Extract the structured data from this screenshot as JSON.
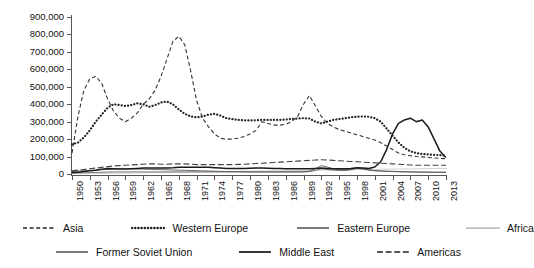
{
  "chart_data": {
    "type": "line",
    "title": "",
    "xlabel": "",
    "ylabel": "",
    "ylim": [
      0,
      900000
    ],
    "xlim": [
      1950,
      2013
    ],
    "grid": false,
    "legend_position": "bottom",
    "y_ticks": [
      "0",
      "100,000",
      "200,000",
      "300,000",
      "400,000",
      "500,000",
      "600,000",
      "700,000",
      "800,000",
      "900,000"
    ],
    "y_tick_values": [
      0,
      100000,
      200000,
      300000,
      400000,
      500000,
      600000,
      700000,
      800000,
      900000
    ],
    "x_ticks": [
      "1950",
      "1953",
      "1956",
      "1959",
      "1962",
      "1965",
      "1968",
      "1971",
      "1974",
      "1977",
      "1980",
      "1983",
      "1986",
      "1989",
      "1992",
      "1995",
      "1998",
      "2001",
      "2004",
      "2007",
      "2010",
      "2013"
    ],
    "x_tick_values": [
      1950,
      1953,
      1956,
      1959,
      1962,
      1965,
      1968,
      1971,
      1974,
      1977,
      1980,
      1983,
      1986,
      1989,
      1992,
      1995,
      1998,
      2001,
      2004,
      2007,
      2010,
      2013
    ],
    "x": [
      1950,
      1951,
      1952,
      1953,
      1954,
      1955,
      1956,
      1957,
      1958,
      1959,
      1960,
      1961,
      1962,
      1963,
      1964,
      1965,
      1966,
      1967,
      1968,
      1969,
      1970,
      1971,
      1972,
      1973,
      1974,
      1975,
      1976,
      1977,
      1978,
      1979,
      1980,
      1981,
      1982,
      1983,
      1984,
      1985,
      1986,
      1987,
      1988,
      1989,
      1990,
      1991,
      1992,
      1993,
      1994,
      1995,
      1996,
      1997,
      1998,
      1999,
      2000,
      2001,
      2002,
      2003,
      2004,
      2005,
      2006,
      2007,
      2008,
      2009,
      2010,
      2011,
      2012,
      2013
    ],
    "series": [
      {
        "name": "Asia",
        "style": "dashed",
        "color": "#333333",
        "values": [
          120000,
          330000,
          480000,
          545000,
          560000,
          520000,
          430000,
          360000,
          320000,
          300000,
          320000,
          350000,
          400000,
          430000,
          480000,
          560000,
          660000,
          760000,
          790000,
          740000,
          590000,
          420000,
          320000,
          270000,
          230000,
          205000,
          200000,
          200000,
          205000,
          215000,
          230000,
          250000,
          300000,
          290000,
          280000,
          280000,
          285000,
          300000,
          330000,
          400000,
          450000,
          390000,
          330000,
          290000,
          270000,
          255000,
          245000,
          235000,
          225000,
          215000,
          205000,
          195000,
          180000,
          160000,
          140000,
          120000,
          110000,
          105000,
          100000,
          98000,
          95000,
          92000,
          90000,
          88000
        ]
      },
      {
        "name": "Western Europe",
        "style": "dotted",
        "color": "#222222",
        "values": [
          170000,
          180000,
          210000,
          250000,
          300000,
          340000,
          380000,
          400000,
          395000,
          390000,
          395000,
          405000,
          400000,
          385000,
          395000,
          410000,
          415000,
          400000,
          370000,
          345000,
          330000,
          325000,
          330000,
          340000,
          345000,
          335000,
          320000,
          315000,
          310000,
          308000,
          307000,
          308000,
          310000,
          310000,
          310000,
          310000,
          312000,
          315000,
          318000,
          320000,
          318000,
          300000,
          290000,
          300000,
          310000,
          315000,
          320000,
          325000,
          328000,
          330000,
          328000,
          320000,
          300000,
          260000,
          220000,
          180000,
          150000,
          130000,
          120000,
          115000,
          112000,
          110000,
          108000,
          105000
        ]
      },
      {
        "name": "Eastern Europe",
        "style": "solid-thin",
        "color": "#555555",
        "values": [
          14000,
          16000,
          18000,
          20000,
          22000,
          24000,
          26000,
          28000,
          30000,
          30000,
          30000,
          29000,
          28000,
          27000,
          26000,
          25000,
          24000,
          23000,
          22000,
          21000,
          20000,
          19000,
          18000,
          17000,
          16000,
          15000,
          14000,
          14000,
          13000,
          13000,
          12000,
          12000,
          12000,
          12000,
          12000,
          12000,
          12000,
          12000,
          12000,
          13000,
          16000,
          30000,
          48000,
          40000,
          30000,
          25000,
          24000,
          28000,
          35000,
          30000,
          24000,
          20000,
          18000,
          16000,
          15000,
          14000,
          13000,
          12000,
          12000,
          11000,
          11000,
          10000,
          10000,
          10000
        ]
      },
      {
        "name": "Africa",
        "style": "fine-dotted",
        "color": "#888888",
        "values": [
          2000,
          2000,
          2000,
          3000,
          3000,
          3000,
          4000,
          4000,
          5000,
          5000,
          6000,
          6000,
          7000,
          7000,
          8000,
          8000,
          9000,
          9000,
          10000,
          10000,
          11000,
          11000,
          12000,
          12000,
          13000,
          13000,
          14000,
          14000,
          15000,
          15000,
          16000,
          16000,
          17000,
          17000,
          18000,
          18000,
          19000,
          19000,
          20000,
          20000,
          21000,
          21000,
          22000,
          22000,
          23000,
          23000,
          24000,
          24000,
          25000,
          25000,
          26000,
          26000,
          27000,
          27000,
          28000,
          28000,
          29000,
          29000,
          30000,
          30000,
          31000,
          31000,
          32000,
          32000
        ]
      },
      {
        "name": "Former Soviet Union",
        "style": "solid-thin",
        "color": "#666666",
        "values": [
          5000,
          6000,
          7000,
          8000,
          9000,
          10000,
          11000,
          12000,
          12000,
          12000,
          12000,
          12000,
          12000,
          12000,
          12000,
          12000,
          12000,
          12000,
          12000,
          12000,
          12000,
          12000,
          12000,
          12000,
          12000,
          12000,
          12000,
          12000,
          12000,
          12000,
          12000,
          12000,
          12000,
          12000,
          12000,
          12000,
          12000,
          12000,
          12000,
          12000,
          14000,
          20000,
          30000,
          26000,
          22000,
          20000,
          20000,
          24000,
          32000,
          28000,
          22000,
          18000,
          16000,
          15000,
          14000,
          13000,
          12000,
          12000,
          11000,
          11000,
          10000,
          10000,
          10000,
          10000
        ]
      },
      {
        "name": "Middle East",
        "style": "solid-thick",
        "color": "#1a1a1a",
        "values": [
          8000,
          10000,
          14000,
          18000,
          22000,
          28000,
          32000,
          30000,
          28000,
          28000,
          30000,
          32000,
          34000,
          34000,
          35000,
          35000,
          35000,
          36000,
          38000,
          38000,
          38000,
          38000,
          38000,
          38000,
          36000,
          34000,
          32000,
          32000,
          32000,
          32000,
          33000,
          34000,
          34000,
          33000,
          32000,
          31000,
          30000,
          30000,
          30000,
          30000,
          30000,
          32000,
          34000,
          32000,
          30000,
          30000,
          30000,
          32000,
          36000,
          34000,
          32000,
          40000,
          70000,
          140000,
          230000,
          290000,
          310000,
          320000,
          300000,
          310000,
          270000,
          200000,
          130000,
          95000
        ]
      },
      {
        "name": "Americas",
        "style": "long-dashed",
        "color": "#444444",
        "values": [
          18000,
          22000,
          26000,
          30000,
          34000,
          38000,
          42000,
          46000,
          48000,
          50000,
          52000,
          54000,
          56000,
          58000,
          58000,
          56000,
          56000,
          58000,
          58000,
          58000,
          56000,
          54000,
          54000,
          54000,
          54000,
          54000,
          54000,
          54000,
          55000,
          56000,
          58000,
          60000,
          62000,
          64000,
          66000,
          68000,
          70000,
          72000,
          74000,
          76000,
          78000,
          80000,
          82000,
          80000,
          78000,
          76000,
          74000,
          72000,
          70000,
          68000,
          66000,
          64000,
          62000,
          60000,
          58000,
          56000,
          54000,
          52000,
          50000,
          50000,
          50000,
          50000,
          50000,
          50000
        ]
      }
    ],
    "legend": [
      {
        "label": "Asia",
        "style": "dashed"
      },
      {
        "label": "Western Europe",
        "style": "dotted"
      },
      {
        "label": "Eastern Europe",
        "style": "solid-thin"
      },
      {
        "label": "Africa",
        "style": "fine-dotted"
      },
      {
        "label": "Former Soviet Union",
        "style": "solid-thin"
      },
      {
        "label": "Middle East",
        "style": "solid-thick"
      },
      {
        "label": "Americas",
        "style": "long-dashed"
      }
    ]
  }
}
